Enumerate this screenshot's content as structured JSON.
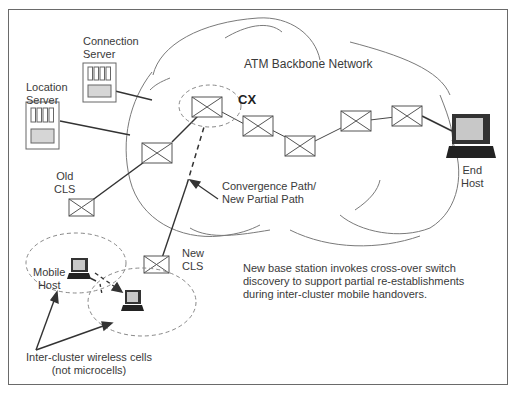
{
  "diagram": {
    "network_title": "ATM Backbone Network",
    "crossover_label": "CX",
    "nodes": {
      "connection_server": [
        "Connection",
        "Server"
      ],
      "location_server": [
        "Location",
        "Server"
      ],
      "old_cls": [
        "Old",
        "CLS"
      ],
      "new_cls": [
        "New",
        "CLS"
      ],
      "mobile_host": [
        "Mobile",
        "Host"
      ],
      "end_host": [
        "End",
        "Host"
      ]
    },
    "convergence_path": [
      "Convergence Path/",
      "New Partial Path"
    ],
    "cells_label": [
      "Inter-cluster wireless cells",
      "(not microcells)"
    ],
    "caption": [
      "New base station invokes cross-over switch",
      "discovery to support partial re-establishments",
      "during inter-cluster mobile handovers."
    ],
    "colors": {
      "line": "#333333",
      "cloud": "#7a7a7a",
      "dashed": "#888888",
      "server_fill": "#d6d6d6",
      "screen_fill": "#c8c8c8"
    }
  }
}
